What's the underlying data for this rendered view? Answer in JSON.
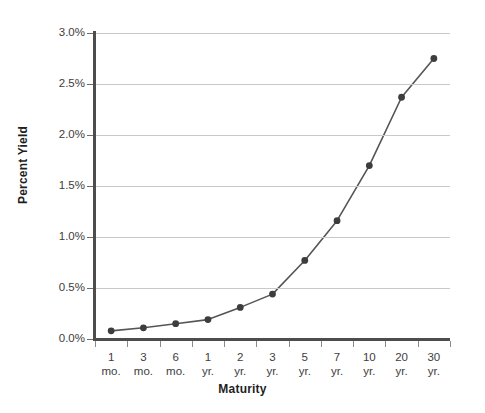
{
  "chart_data": {
    "type": "line",
    "title": "",
    "xlabel": "Maturity",
    "ylabel": "Percent Yield",
    "categories": [
      "1 mo.",
      "3 mo.",
      "6 mo.",
      "1 yr.",
      "2 yr.",
      "3 yr.",
      "5 yr.",
      "7 yr.",
      "10 yr.",
      "20 yr.",
      "30 yr."
    ],
    "category_lines": [
      {
        "top": "1",
        "bottom": "mo."
      },
      {
        "top": "3",
        "bottom": "mo."
      },
      {
        "top": "6",
        "bottom": "mo."
      },
      {
        "top": "1",
        "bottom": "yr."
      },
      {
        "top": "2",
        "bottom": "yr."
      },
      {
        "top": "3",
        "bottom": "yr."
      },
      {
        "top": "5",
        "bottom": "yr."
      },
      {
        "top": "7",
        "bottom": "yr."
      },
      {
        "top": "10",
        "bottom": "yr."
      },
      {
        "top": "20",
        "bottom": "yr."
      },
      {
        "top": "30",
        "bottom": "yr."
      }
    ],
    "values": [
      0.08,
      0.11,
      0.15,
      0.19,
      0.31,
      0.44,
      0.77,
      1.16,
      1.7,
      2.37,
      2.75
    ],
    "ylim": [
      0.0,
      3.0
    ],
    "ytick_values": [
      0.0,
      0.5,
      1.0,
      1.5,
      2.0,
      2.5,
      3.0
    ],
    "ytick_labels": [
      "0.0%",
      "0.5%",
      "1.0%",
      "1.5%",
      "2.0%",
      "2.5%",
      "3.0%"
    ],
    "grid": true,
    "legend": "none",
    "series_color": "#555555",
    "marker_color": "#3d3d3d",
    "gridline_color": "#c9c9c9",
    "axis_color": "#4d4d4d"
  }
}
